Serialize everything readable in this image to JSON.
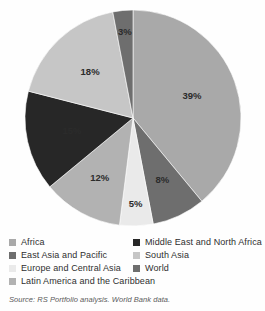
{
  "figure": {
    "source_note": "Source: RS Portfolio analysis. World Bank data."
  },
  "chart_data": {
    "type": "pie",
    "title": "",
    "xlabel": "",
    "ylabel": "",
    "grid": false,
    "legend_position": "bottom",
    "units": "percent",
    "start_angle_deg": 0,
    "direction": "clockwise",
    "categories": [
      "Africa",
      "East Asia and Pacific",
      "Europe and Central Asia",
      "Latin America and the Caribbean",
      "Middle East and North Africa",
      "South Asia",
      "World"
    ],
    "values": [
      39,
      8,
      5,
      12,
      15,
      18,
      3
    ],
    "slices": [
      {
        "label": "Africa",
        "value": 39,
        "display": "39%",
        "color": "#a9a9a9",
        "label_color": "#2b2b2b"
      },
      {
        "label": "East Asia and Pacific",
        "value": 8,
        "display": "8%",
        "color": "#6e6e6e",
        "label_color": "#ffffff"
      },
      {
        "label": "Europe and Central Asia",
        "value": 5,
        "display": "5%",
        "color": "#eaeaea",
        "label_color": "#2b2b2b"
      },
      {
        "label": "Latin America and the Caribbean",
        "value": 12,
        "display": "12%",
        "color": "#b2b2b2",
        "label_color": "#2b2b2b"
      },
      {
        "label": "Middle East and North Africa",
        "value": 15,
        "display": "15%",
        "color": "#272727",
        "label_color": "#ffffff"
      },
      {
        "label": "South Asia",
        "value": 18,
        "display": "18%",
        "color": "#c6c6c6",
        "label_color": "#2b2b2b"
      },
      {
        "label": "World",
        "value": 3,
        "display": "3%",
        "color": "#6e6e6e",
        "label_color": "#ffffff"
      }
    ]
  },
  "legend": {
    "left_column": [
      {
        "label": "Africa",
        "color": "#a9a9a9"
      },
      {
        "label": "East Asia and Pacific",
        "color": "#6e6e6e"
      },
      {
        "label": "Europe and Central Asia",
        "color": "#eaeaea"
      },
      {
        "label": "Latin America and the Caribbean",
        "color": "#b2b2b2"
      }
    ],
    "right_column": [
      {
        "label": "Middle East and North Africa",
        "color": "#272727"
      },
      {
        "label": "South Asia",
        "color": "#c6c6c6"
      },
      {
        "label": "World",
        "color": "#6e6e6e"
      }
    ]
  }
}
